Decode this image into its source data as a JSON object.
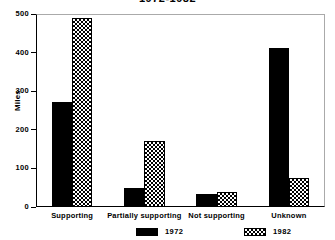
{
  "chart_data": {
    "type": "bar",
    "title": "1972-1982",
    "xlabel": "",
    "ylabel": "Miles",
    "ylim": [
      0,
      500
    ],
    "yticks": [
      0,
      100,
      200,
      300,
      400,
      500
    ],
    "ytick_labels": [
      "0",
      "100",
      "200",
      "300",
      "400",
      "500"
    ],
    "grid": false,
    "legend_position": "bottom",
    "categories": [
      "Supporting",
      "Partially supporting",
      "Not supporting",
      "Unknown"
    ],
    "series": [
      {
        "name": "1972",
        "fill": "solid-black",
        "values": [
          272,
          48,
          33,
          413
        ]
      },
      {
        "name": "1982",
        "fill": "checkerboard",
        "values": [
          489,
          170,
          40,
          75
        ]
      }
    ]
  },
  "colors": {
    "foreground": "#000000",
    "background": "#ffffff",
    "frame": "#aaaaaa"
  }
}
